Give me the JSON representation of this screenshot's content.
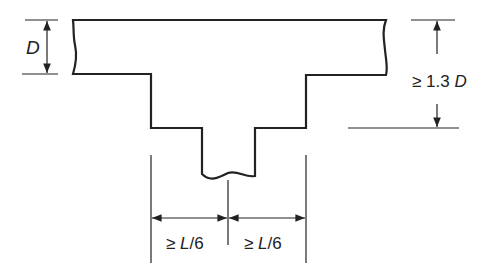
{
  "diagram": {
    "type": "T-beam flange dimension sketch",
    "labels": {
      "flange_depth": "D",
      "web_depth_symbol": "≥ 1.3 ",
      "web_depth_var": "D",
      "left_width_symbol": "≥ ",
      "left_width_var": "L",
      "left_width_rest": "/6",
      "right_width_symbol": "≥ ",
      "right_width_var": "L",
      "right_width_rest": "/6"
    },
    "colors": {
      "line": "#222222",
      "background": "#ffffff"
    }
  }
}
